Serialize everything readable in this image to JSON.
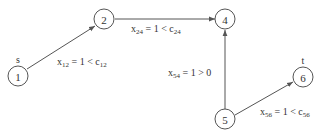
{
  "diagram": {
    "type": "network-flow",
    "nodes": [
      {
        "id": "1",
        "label": "1",
        "role_label": "s"
      },
      {
        "id": "2",
        "label": "2",
        "role_label": ""
      },
      {
        "id": "4",
        "label": "4",
        "role_label": ""
      },
      {
        "id": "5",
        "label": "5",
        "role_label": ""
      },
      {
        "id": "6",
        "label": "6",
        "role_label": "t"
      }
    ],
    "edges": [
      {
        "from": "1",
        "to": "2",
        "var": "x",
        "sub": "12",
        "rel": " = 1 < ",
        "bound": "c",
        "bound_sub": "12"
      },
      {
        "from": "2",
        "to": "4",
        "var": "x",
        "sub": "24",
        "rel": " = 1 < ",
        "bound": "c",
        "bound_sub": "24"
      },
      {
        "from": "5",
        "to": "4",
        "var": "x",
        "sub": "54",
        "rel": " = 1 > 0",
        "bound": "",
        "bound_sub": ""
      },
      {
        "from": "5",
        "to": "6",
        "var": "x",
        "sub": "56",
        "rel": " = 1 < ",
        "bound": "c",
        "bound_sub": "56"
      }
    ]
  }
}
